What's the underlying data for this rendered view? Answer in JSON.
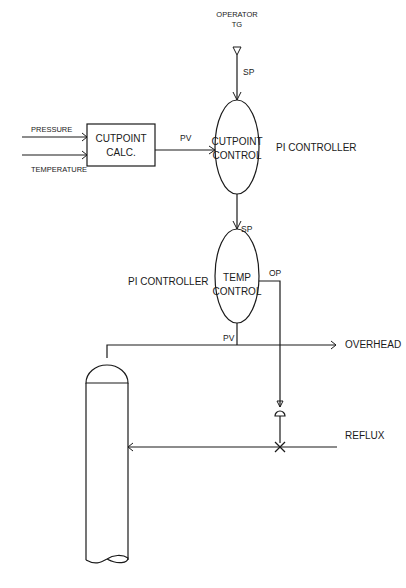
{
  "diagram": {
    "type": "process control diagram",
    "operator": {
      "line1": "OPERATOR",
      "line2": "TG"
    },
    "inputs": {
      "pressure": "PRESSURE",
      "temperature": "TEMPERATURE"
    },
    "cutpoint_calc": {
      "line1": "CUTPOINT",
      "line2": "CALC."
    },
    "cutpoint_control": {
      "line1": "CUTPOINT",
      "line2": "CONTROL",
      "type_label": "PI CONTROLLER"
    },
    "temp_control": {
      "line1": "TEMP",
      "line2": "CONTROL",
      "type_label": "PI CONTROLLER"
    },
    "signals": {
      "sp_top": "SP",
      "pv_calc": "PV",
      "sp_temp": "SP",
      "op": "OP",
      "pv_temp": "PV"
    },
    "streams": {
      "overhead": "OVERHEAD",
      "reflux": "REFLUX"
    }
  }
}
